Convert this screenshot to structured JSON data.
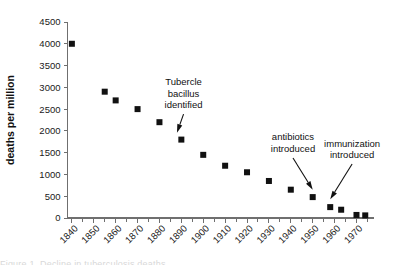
{
  "chart_data": {
    "type": "scatter",
    "title": "",
    "xlabel": "",
    "ylabel": "deaths per million",
    "xlim": [
      1838,
      1978
    ],
    "ylim": [
      0,
      4500
    ],
    "grid": false,
    "legend": "none",
    "x_tick_labels": [
      "1840",
      "1850",
      "1860",
      "1870",
      "1880",
      "1890",
      "1900",
      "1910",
      "1920",
      "1930",
      "1940",
      "1950",
      "1960",
      "1970"
    ],
    "x_tick_values": [
      1840,
      1850,
      1860,
      1870,
      1880,
      1890,
      1900,
      1910,
      1920,
      1930,
      1940,
      1950,
      1960,
      1970
    ],
    "x_minor_tick_interval": 5,
    "y_tick_labels": [
      "0",
      "500",
      "1000",
      "1500",
      "2000",
      "2500",
      "3000",
      "3500",
      "4000",
      "4500"
    ],
    "y_tick_values": [
      0,
      500,
      1000,
      1500,
      2000,
      2500,
      3000,
      3500,
      4000,
      4500
    ],
    "points": [
      {
        "x": 1840,
        "y": 4000
      },
      {
        "x": 1855,
        "y": 2900
      },
      {
        "x": 1860,
        "y": 2700
      },
      {
        "x": 1870,
        "y": 2500
      },
      {
        "x": 1880,
        "y": 2200
      },
      {
        "x": 1890,
        "y": 1800
      },
      {
        "x": 1900,
        "y": 1450
      },
      {
        "x": 1910,
        "y": 1200
      },
      {
        "x": 1920,
        "y": 1050
      },
      {
        "x": 1930,
        "y": 850
      },
      {
        "x": 1940,
        "y": 650
      },
      {
        "x": 1950,
        "y": 480
      },
      {
        "x": 1958,
        "y": 250
      },
      {
        "x": 1963,
        "y": 190
      },
      {
        "x": 1970,
        "y": 70
      },
      {
        "x": 1974,
        "y": 60
      }
    ],
    "annotations": [
      {
        "id": "tubercle",
        "lines": [
          "Tubercle",
          "bacillus",
          "identified"
        ],
        "text_x": 1891,
        "text_y": 3050,
        "target_x": 1888,
        "target_y": 1960
      },
      {
        "id": "antibiotics",
        "lines": [
          "antibiotics",
          "introduced"
        ],
        "text_x": 1941,
        "text_y": 1780,
        "target_x": 1950,
        "target_y": 650
      },
      {
        "id": "immunization",
        "lines": [
          "immunization",
          "introduced"
        ],
        "text_x": 1968,
        "text_y": 1640,
        "target_x": 1958,
        "target_y": 430
      }
    ]
  },
  "caption": {
    "cropped_text": "Figure 1. Decline in tuberculosis deaths"
  }
}
